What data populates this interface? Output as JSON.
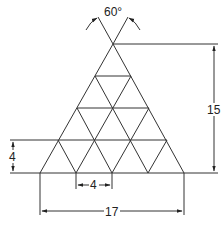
{
  "diagram": {
    "type": "triangular truss dimension drawing",
    "line_color": "#333333",
    "angle_label": "60°",
    "dimensions": {
      "height": "15",
      "row_height": "4",
      "member_spacing": "4",
      "base_width": "17"
    }
  }
}
